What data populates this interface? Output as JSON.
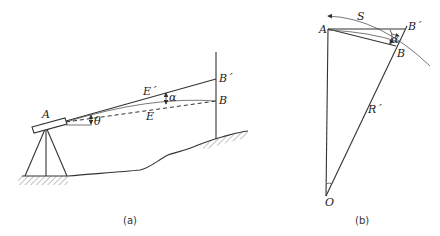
{
  "figure_a": {
    "caption": "(a)",
    "labels": {
      "A": "A",
      "B": "B",
      "B_prime": "B´",
      "E": "E",
      "E_prime": "E´",
      "alpha": "α",
      "theta": "θ"
    }
  },
  "figure_b": {
    "caption": "(b)",
    "labels": {
      "A": "A",
      "B": "B",
      "B_prime": "B´",
      "S": "S",
      "R_prime": "R´",
      "O": "O",
      "alpha": "α"
    }
  }
}
